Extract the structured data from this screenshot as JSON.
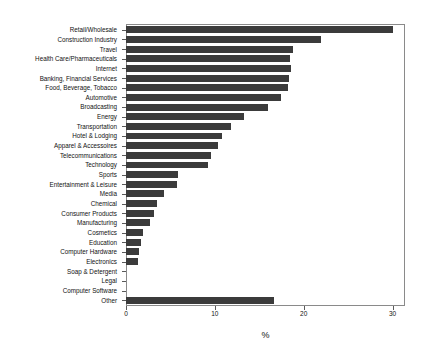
{
  "chart_data": {
    "type": "bar",
    "orientation": "horizontal",
    "title": "",
    "xlabel": "%",
    "ylabel": "",
    "xlim": [
      0,
      31.4
    ],
    "xticks": [
      0,
      10,
      20,
      30
    ],
    "xticklabels": [
      "0",
      "10",
      "20",
      "30"
    ],
    "grid": false,
    "legend": false,
    "bar_color": "#3b3b3b",
    "frame_color": "#8a8a8a",
    "categories": [
      "Retail/Wholesale",
      "Construction Industry",
      "Travel",
      "Health Care/Pharmaceuticals",
      "Internet",
      "Banking, Financial Services",
      "Food, Beverage, Tobacco",
      "Automotive",
      "Broadcasting",
      "Energy",
      "Transportation",
      "Hotel & Lodging",
      "Apparel & Accessoires",
      "Telecommunications",
      "Technology",
      "Sports",
      "Entertainment & Leisure",
      "Media",
      "Chemical",
      "Consumer Products",
      "Manufacturing",
      "Cosmetics",
      "Education",
      "Computer Hardware",
      "Electronics",
      "Soap & Detergent",
      "Legal",
      "Computer Software",
      "Other"
    ],
    "values": [
      30.0,
      22.0,
      18.8,
      18.5,
      18.6,
      18.3,
      18.2,
      17.4,
      16.0,
      13.3,
      11.8,
      10.8,
      10.3,
      9.6,
      9.2,
      5.8,
      5.7,
      4.3,
      3.5,
      3.2,
      2.7,
      1.9,
      1.7,
      1.5,
      1.3,
      0.0,
      0.0,
      0.0,
      16.7
    ]
  }
}
